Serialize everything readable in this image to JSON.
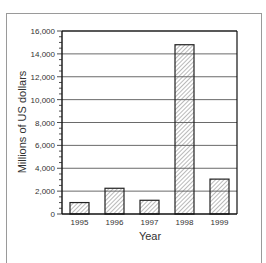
{
  "chart_data": {
    "type": "bar",
    "title": "",
    "xlabel": "Year",
    "ylabel": "Millions of US dollars",
    "categories": [
      "1995",
      "1996",
      "1997",
      "1998",
      "1999"
    ],
    "values": [
      1000,
      2250,
      1200,
      14800,
      3050
    ],
    "ylim": [
      0,
      16000
    ],
    "yticks": [
      0,
      2000,
      4000,
      6000,
      8000,
      10000,
      12000,
      14000,
      16000
    ],
    "ytick_labels": [
      "0",
      "2,000",
      "4,000",
      "6,000",
      "8,000",
      "10,000",
      "12,000",
      "14,000",
      "16,000"
    ],
    "minor_tick_step": 500,
    "grid": true,
    "legend": null,
    "bar_fill": "diagonal-hatch",
    "colors": {
      "bar_stroke": "#222222",
      "hatch": "#555555",
      "grid": "#444444",
      "frame": "#9a9a9a"
    }
  }
}
